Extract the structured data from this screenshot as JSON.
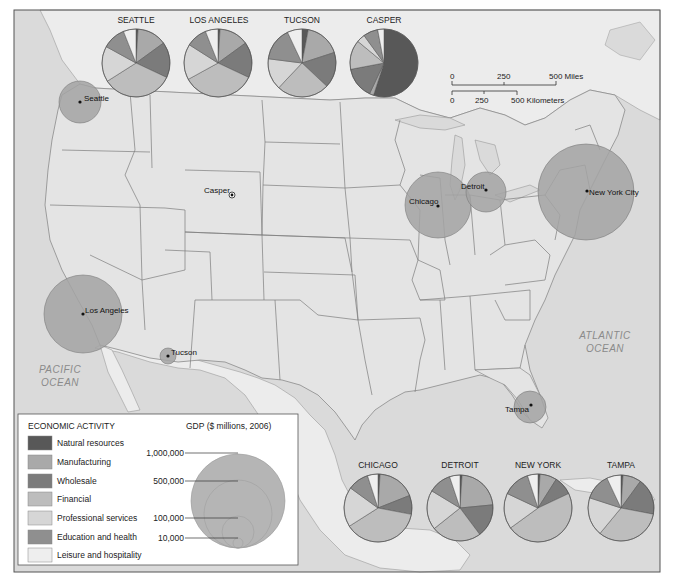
{
  "map": {
    "frame_color": "#555555",
    "ocean_color": "#d9d9d9",
    "us_land_color": "#e6e6e6",
    "foreign_land_color": "#eeeeee",
    "ocean_labels": [
      {
        "line1": "PACIFIC",
        "line2": "OCEAN"
      },
      {
        "line1": "ATLANTIC",
        "line2": "OCEAN"
      }
    ]
  },
  "scale_bar": {
    "miles": {
      "ticks": [
        "0",
        "250",
        "500 Miles"
      ]
    },
    "kilometers": {
      "ticks": [
        "0",
        "250",
        "500 Kilometers"
      ]
    }
  },
  "categories": [
    {
      "name": "Natural resources",
      "color": "#585858"
    },
    {
      "name": "Manufacturing",
      "color": "#a9a9a9"
    },
    {
      "name": "Wholesale",
      "color": "#7b7b7b"
    },
    {
      "name": "Financial",
      "color": "#bdbdbd"
    },
    {
      "name": "Professional services",
      "color": "#d6d6d6"
    },
    {
      "name": "Education and health",
      "color": "#8f8f8f"
    },
    {
      "name": "Leisure and hospitality",
      "color": "#eeeeee"
    }
  ],
  "legend": {
    "title": "ECONOMIC ACTIVITY",
    "gdp_title": "GDP ($ millions, 2006)",
    "gdp_circle_color": "#b3b3b3",
    "gdp_levels": [
      "1,000,000",
      "500,000",
      "100,000",
      "10,000"
    ]
  },
  "cities": [
    {
      "name": "Seattle",
      "label": "Seattle",
      "gdp_circle_color": "#a8a8a8"
    },
    {
      "name": "Los Angeles",
      "label": "Los Angeles",
      "gdp_circle_color": "#a8a8a8"
    },
    {
      "name": "Tucson",
      "label": "Tucson",
      "gdp_circle_color": "#a8a8a8"
    },
    {
      "name": "Casper",
      "label": "Casper",
      "gdp_circle_color": "#a8a8a8"
    },
    {
      "name": "Chicago",
      "label": "Chicago",
      "gdp_circle_color": "#a8a8a8"
    },
    {
      "name": "Detroit",
      "label": "Detroit",
      "gdp_circle_color": "#a8a8a8"
    },
    {
      "name": "New York City",
      "label": "New York City",
      "gdp_circle_color": "#a8a8a8"
    },
    {
      "name": "Tampa",
      "label": "Tampa",
      "gdp_circle_color": "#a8a8a8"
    }
  ],
  "pies": {
    "top": [
      {
        "title": "SEATTLE",
        "shares": [
          1,
          14,
          17,
          34,
          17,
          11,
          6
        ]
      },
      {
        "title": "LOS ANGELES",
        "shares": [
          1,
          14,
          17,
          35,
          17,
          10,
          6
        ]
      },
      {
        "title": "TUCSON",
        "shares": [
          3,
          17,
          17,
          25,
          15,
          16,
          7
        ]
      },
      {
        "title": "CASPER",
        "shares": [
          55,
          2,
          15,
          14,
          4,
          7,
          3
        ]
      }
    ],
    "bottom": [
      {
        "title": "CHICAGO",
        "shares": [
          1,
          18,
          9,
          38,
          19,
          10,
          5
        ]
      },
      {
        "title": "DETROIT",
        "shares": [
          1,
          22,
          16,
          24,
          19,
          11,
          5
        ]
      },
      {
        "title": "NEW YORK",
        "shares": [
          1,
          8,
          9,
          47,
          17,
          13,
          5
        ]
      },
      {
        "title": "TAMPA",
        "shares": [
          1,
          9,
          18,
          33,
          19,
          13,
          7
        ]
      }
    ]
  },
  "chart_data": {
    "type": "pie",
    "categories": [
      "Natural resources",
      "Manufacturing",
      "Wholesale",
      "Financial",
      "Professional services",
      "Education and health",
      "Leisure and hospitality"
    ],
    "series": [
      {
        "name": "Seattle",
        "values": [
          1,
          14,
          17,
          34,
          17,
          11,
          6
        ]
      },
      {
        "name": "Los Angeles",
        "values": [
          1,
          14,
          17,
          35,
          17,
          10,
          6
        ]
      },
      {
        "name": "Tucson",
        "values": [
          3,
          17,
          17,
          25,
          15,
          16,
          7
        ]
      },
      {
        "name": "Casper",
        "values": [
          55,
          2,
          15,
          14,
          4,
          7,
          3
        ]
      },
      {
        "name": "Chicago",
        "values": [
          1,
          18,
          9,
          38,
          19,
          10,
          5
        ]
      },
      {
        "name": "Detroit",
        "values": [
          1,
          22,
          16,
          24,
          19,
          11,
          5
        ]
      },
      {
        "name": "New York",
        "values": [
          1,
          8,
          9,
          47,
          17,
          13,
          5
        ]
      },
      {
        "name": "Tampa",
        "values": [
          1,
          9,
          18,
          33,
          19,
          13,
          7
        ]
      }
    ],
    "gdp_scale_ticks": [
      1000000,
      500000,
      100000,
      10000
    ],
    "gdp_estimates_millions": {
      "New York City": 1100000,
      "Los Angeles": 700000,
      "Chicago": 480000,
      "Seattle": 200000,
      "Detroit": 200000,
      "Tampa": 100000,
      "Tucson": 30000,
      "Casper": 4000
    },
    "units": "percent of GDP (estimated)"
  }
}
